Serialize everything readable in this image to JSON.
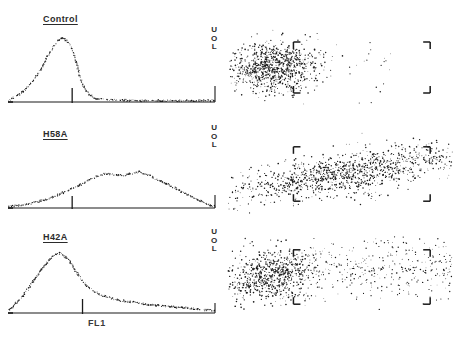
{
  "figure": {
    "type": "flow-cytometry-figure",
    "width": 453,
    "height": 344,
    "background": "#ffffff",
    "ink_color": "#1a1a1a",
    "rows": 3,
    "columns": 2,
    "x_axis_label": "FL1"
  },
  "panels": [
    {
      "label": "Control",
      "uol": {
        "upper": "U",
        "middle": "O",
        "lower": "L"
      }
    },
    {
      "label": "H58A",
      "uol": {
        "upper": "U",
        "middle": "O",
        "lower": "L"
      }
    },
    {
      "label": "H42A",
      "uol": {
        "upper": "U",
        "middle": "O",
        "lower": "L"
      }
    }
  ],
  "chart_data": [
    {
      "id": "histogram-control",
      "type": "line",
      "title": "Control",
      "xlabel": "FL1",
      "ylabel": "Cell number",
      "xlim": [
        0,
        200
      ],
      "ylim": [
        0,
        100
      ],
      "grid": false,
      "marker_x": 62,
      "x": [
        0,
        4,
        8,
        12,
        16,
        20,
        24,
        28,
        32,
        36,
        40,
        44,
        48,
        52,
        56,
        60,
        64,
        68,
        72,
        78,
        84,
        92,
        100,
        110,
        120,
        132,
        146,
        160,
        176,
        192,
        200
      ],
      "values": [
        2,
        5,
        9,
        13,
        18,
        24,
        31,
        40,
        50,
        62,
        74,
        84,
        92,
        96,
        94,
        86,
        70,
        48,
        26,
        12,
        6,
        4,
        3,
        3,
        2,
        2,
        2,
        2,
        2,
        2,
        2
      ]
    },
    {
      "id": "histogram-h58a",
      "type": "line",
      "title": "H58A",
      "xlabel": "FL1",
      "ylabel": "Cell number",
      "xlim": [
        0,
        200
      ],
      "ylim": [
        0,
        100
      ],
      "grid": false,
      "marker_x": 62,
      "x": [
        0,
        8,
        16,
        24,
        32,
        40,
        48,
        56,
        62,
        70,
        78,
        86,
        94,
        102,
        110,
        118,
        126,
        134,
        142,
        150,
        158,
        166,
        174,
        182,
        190,
        196,
        200
      ],
      "values": [
        2,
        3,
        5,
        8,
        11,
        15,
        20,
        26,
        30,
        36,
        43,
        49,
        53,
        52,
        50,
        53,
        56,
        52,
        46,
        40,
        34,
        27,
        20,
        14,
        8,
        4,
        3
      ]
    },
    {
      "id": "histogram-h42a",
      "type": "line",
      "title": "H42A",
      "xlabel": "FL1",
      "ylabel": "Cell number",
      "xlim": [
        0,
        200
      ],
      "ylim": [
        0,
        100
      ],
      "grid": false,
      "marker_x": 72,
      "x": [
        0,
        4,
        8,
        14,
        20,
        26,
        32,
        38,
        44,
        50,
        56,
        62,
        68,
        74,
        80,
        88,
        96,
        106,
        118,
        130,
        142,
        156,
        170,
        184,
        196,
        200
      ],
      "values": [
        3,
        8,
        16,
        26,
        38,
        52,
        66,
        78,
        88,
        92,
        86,
        74,
        58,
        45,
        36,
        29,
        24,
        20,
        17,
        14,
        12,
        10,
        8,
        6,
        4,
        4
      ]
    },
    {
      "id": "scatter-control",
      "type": "scatter",
      "title": "Control",
      "xlabel": "FL1",
      "ylabel": "Side scatter",
      "xlim": [
        0,
        220
      ],
      "ylim": [
        0,
        100
      ],
      "grid": false,
      "gate": {
        "x0": 62,
        "y0": 16,
        "x1": 200,
        "y1": 84,
        "shape": "corner-brackets"
      },
      "cluster": {
        "center_x": 42,
        "center_y": 50,
        "spread_x": 22,
        "spread_y": 16,
        "n_points": 900
      },
      "tail": {
        "n_points": 40,
        "extent_x": 120
      }
    },
    {
      "id": "scatter-h58a",
      "type": "scatter",
      "title": "H58A",
      "xlabel": "FL1",
      "ylabel": "Side scatter",
      "xlim": [
        0,
        220
      ],
      "ylim": [
        0,
        100
      ],
      "grid": false,
      "gate": {
        "x0": 62,
        "y0": 16,
        "x1": 200,
        "y1": 84,
        "shape": "corner-brackets"
      },
      "cluster": {
        "center_x": 112,
        "center_y": 50,
        "spread_x": 56,
        "spread_y": 13,
        "n_points": 1100
      },
      "tail": {
        "n_points": 120,
        "extent_x": 200
      }
    },
    {
      "id": "scatter-h42a",
      "type": "scatter",
      "title": "H42A",
      "xlabel": "FL1",
      "ylabel": "Side scatter",
      "xlim": [
        0,
        220
      ],
      "ylim": [
        0,
        100
      ],
      "grid": false,
      "gate": {
        "x0": 62,
        "y0": 16,
        "x1": 200,
        "y1": 84,
        "shape": "corner-brackets"
      },
      "cluster": {
        "center_x": 40,
        "center_y": 52,
        "spread_x": 22,
        "spread_y": 16,
        "n_points": 700
      },
      "tail": {
        "n_points": 420,
        "extent_x": 190
      }
    }
  ]
}
